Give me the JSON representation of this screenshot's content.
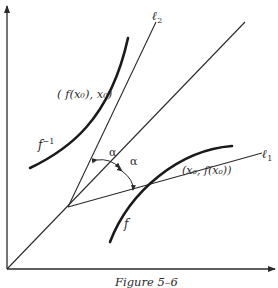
{
  "figure": {
    "caption": "Figure 5–6",
    "labels": {
      "l2": "ℓ",
      "l2_sub": "2",
      "l1": "ℓ",
      "l1_sub": "1",
      "point_inverse": "( f(x₀), x₀)",
      "point_f": "(x₀, f(x₀))",
      "f_inverse": "f",
      "f_inverse_sup": "−1",
      "f": "f",
      "alpha_top": "α",
      "alpha_bottom": "α"
    },
    "colors": {
      "ink": "#2a2a2a",
      "background": "#ffffff"
    }
  }
}
